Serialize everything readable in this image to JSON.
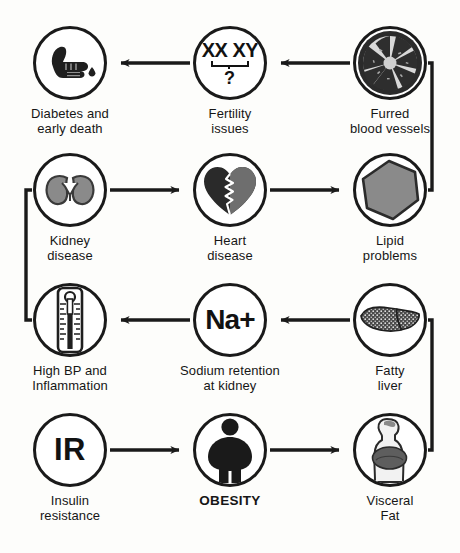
{
  "diagram": {
    "type": "flow-cycle",
    "canvas": {
      "width": 460,
      "height": 553
    },
    "colors": {
      "background": "#fdfdfb",
      "stroke": "#1a1a1a",
      "icon_dark": "#1f1f1f",
      "icon_gray": "#8a8a8a",
      "icon_mid_gray": "#6e6e6e",
      "text": "#161616"
    },
    "nodes": [
      {
        "id": "diabetes",
        "icon": "finger-prick-blood-drop-icon",
        "label": "Diabetes and\nearly death",
        "label_line1": "Diabetes and",
        "label_line2": "early death",
        "glyph": "",
        "bold_label": false,
        "row": 1,
        "col": 1,
        "cx": 70,
        "cy": 63
      },
      {
        "id": "fertility",
        "icon": "chromosome-xx-xy-icon",
        "label": "Fertility\nissues",
        "label_line1": "Fertility",
        "label_line2": "issues",
        "glyph": "XX XY ?",
        "bold_label": false,
        "row": 1,
        "col": 2,
        "cx": 230,
        "cy": 63
      },
      {
        "id": "furred-vessels",
        "icon": "artery-cross-section-plaque-icon",
        "label": "Furred\nblood vessels",
        "label_line1": "Furred",
        "label_line2": "blood vessels",
        "glyph": "",
        "bold_label": false,
        "row": 1,
        "col": 3,
        "cx": 390,
        "cy": 63
      },
      {
        "id": "kidney",
        "icon": "kidneys-icon",
        "label": "Kidney\ndisease",
        "label_line1": "Kidney",
        "label_line2": "disease",
        "glyph": "",
        "bold_label": false,
        "row": 2,
        "col": 1,
        "cx": 70,
        "cy": 190
      },
      {
        "id": "heart",
        "icon": "cracked-heart-icon",
        "label": "Heart\ndisease",
        "label_line1": "Heart",
        "label_line2": "disease",
        "glyph": "",
        "bold_label": false,
        "row": 2,
        "col": 2,
        "cx": 230,
        "cy": 190
      },
      {
        "id": "lipid",
        "icon": "lipid-droplet-hexagon-icon",
        "label": "Lipid\nproblems",
        "label_line1": "Lipid",
        "label_line2": "problems",
        "glyph": "",
        "bold_label": false,
        "row": 2,
        "col": 3,
        "cx": 390,
        "cy": 190
      },
      {
        "id": "high-bp",
        "icon": "thermometer-icon",
        "label": "High BP and\nInflammation",
        "label_line1": "High BP and",
        "label_line2": "Inflammation",
        "glyph": "",
        "bold_label": false,
        "row": 3,
        "col": 1,
        "cx": 70,
        "cy": 320
      },
      {
        "id": "sodium",
        "icon": "sodium-ion-icon",
        "label": "Sodium retention\nat kidney",
        "label_line1": "Sodium retention",
        "label_line2": "at kidney",
        "glyph": "Na+",
        "bold_label": false,
        "row": 3,
        "col": 2,
        "cx": 230,
        "cy": 320
      },
      {
        "id": "fatty-liver",
        "icon": "fatty-liver-icon",
        "label": "Fatty\nliver",
        "label_line1": "Fatty",
        "label_line2": "liver",
        "glyph": "",
        "bold_label": false,
        "row": 3,
        "col": 3,
        "cx": 390,
        "cy": 320
      },
      {
        "id": "insulin-resistance",
        "icon": "insulin-resistance-ir-icon",
        "label": "Insulin\nresistance",
        "label_line1": "Insulin",
        "label_line2": "resistance",
        "glyph": "IR",
        "bold_label": false,
        "row": 4,
        "col": 1,
        "cx": 70,
        "cy": 450
      },
      {
        "id": "obesity",
        "icon": "obese-person-icon",
        "label": "OBESITY",
        "label_line1": "OBESITY",
        "label_line2": "",
        "glyph": "",
        "bold_label": true,
        "row": 4,
        "col": 2,
        "cx": 230,
        "cy": 450
      },
      {
        "id": "visceral-fat",
        "icon": "visceral-fat-body-icon",
        "label": "Visceral\nFat",
        "label_line1": "Visceral",
        "label_line2": "Fat",
        "glyph": "",
        "bold_label": false,
        "row": 4,
        "col": 3,
        "cx": 390,
        "cy": 450
      }
    ],
    "edges": [
      {
        "id": "ir-to-obesity",
        "from": "insulin-resistance",
        "to": "obesity",
        "direction": "right"
      },
      {
        "id": "obesity-to-visceral",
        "from": "obesity",
        "to": "visceral-fat",
        "direction": "right"
      },
      {
        "id": "visceral-to-fatty",
        "from": "visceral-fat",
        "to": "fatty-liver",
        "direction": "wrap-right-up"
      },
      {
        "id": "fatty-to-sodium",
        "from": "fatty-liver",
        "to": "sodium",
        "direction": "left"
      },
      {
        "id": "sodium-to-bp",
        "from": "sodium",
        "to": "high-bp",
        "direction": "left"
      },
      {
        "id": "bp-to-kidney",
        "from": "high-bp",
        "to": "kidney",
        "direction": "wrap-left-up"
      },
      {
        "id": "kidney-to-heart",
        "from": "kidney",
        "to": "heart",
        "direction": "right"
      },
      {
        "id": "heart-to-lipid",
        "from": "heart",
        "to": "lipid",
        "direction": "right"
      },
      {
        "id": "lipid-to-furred",
        "from": "lipid",
        "to": "furred-vessels",
        "direction": "wrap-right-up"
      },
      {
        "id": "furred-to-fertility",
        "from": "furred-vessels",
        "to": "fertility",
        "direction": "left"
      },
      {
        "id": "fertility-to-diabetes",
        "from": "fertility",
        "to": "diabetes",
        "direction": "left"
      }
    ]
  }
}
